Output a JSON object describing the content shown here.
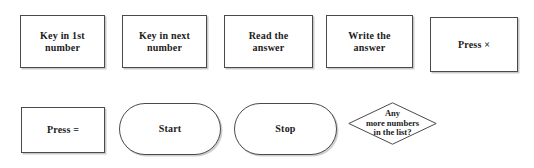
{
  "diagram": {
    "background_color": "#ffffff",
    "text_color": "#1b1b1b",
    "border_color": "#4a4a4a",
    "shadow_color": "#c9c9c9"
  },
  "shapes": [
    {
      "id": "key-in-1st-number",
      "kind": "process",
      "text": "Key in 1st\nnumber",
      "x": 20,
      "y": 15,
      "w": 85,
      "h": 53
    },
    {
      "id": "key-in-next-number",
      "kind": "process",
      "text": "Key in next\nnumber",
      "x": 122,
      "y": 15,
      "w": 85,
      "h": 53
    },
    {
      "id": "read-the-answer",
      "kind": "process",
      "text": "Read the\nanswer",
      "x": 224,
      "y": 15,
      "w": 89,
      "h": 53
    },
    {
      "id": "write-the-answer",
      "kind": "process",
      "text": "Write the\nanswer",
      "x": 326,
      "y": 15,
      "w": 87,
      "h": 53
    },
    {
      "id": "press-times",
      "kind": "process",
      "text": "Press  ×",
      "x": 430,
      "y": 17,
      "w": 88,
      "h": 55
    },
    {
      "id": "press-equals",
      "kind": "process",
      "text": "Press  =",
      "x": 21,
      "y": 107,
      "w": 84,
      "h": 46
    },
    {
      "id": "start",
      "kind": "terminator",
      "text": "Start",
      "x": 119,
      "y": 103,
      "w": 102,
      "h": 52
    },
    {
      "id": "stop",
      "kind": "terminator",
      "text": "Stop",
      "x": 234,
      "y": 103,
      "w": 103,
      "h": 52
    },
    {
      "id": "any-more-numbers",
      "kind": "decision",
      "text": "Any\nmore numbers\nin the list?",
      "x": 348,
      "y": 102,
      "w": 89,
      "h": 43
    }
  ]
}
